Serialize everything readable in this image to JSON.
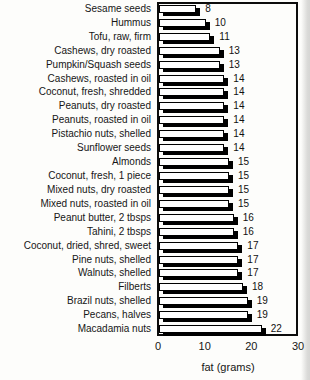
{
  "chart_data": {
    "type": "bar",
    "orientation": "horizontal",
    "categories": [
      "Sesame seeds",
      "Hummus",
      "Tofu, raw, firm",
      "Cashews, dry roasted",
      "Pumpkin/Squash seeds",
      "Cashews, roasted in oil",
      "Coconut, fresh, shredded",
      "Peanuts, dry roasted",
      "Peanuts, roasted in oil",
      "Pistachio nuts, shelled",
      "Sunflower seeds",
      "Almonds",
      "Coconut, fresh, 1 piece",
      "Mixed nuts, dry roasted",
      "Mixed nuts, roasted in oil",
      "Peanut butter, 2 tbsps",
      "Tahini, 2 tbsps",
      "Coconut, dried, shred, sweet",
      "Pine nuts, shelled",
      "Walnuts, shelled",
      "Filberts",
      "Brazil nuts, shelled",
      "Pecans, halves",
      "Macadamia nuts"
    ],
    "values": [
      8,
      10,
      11,
      13,
      13,
      14,
      14,
      14,
      14,
      14,
      14,
      15,
      15,
      15,
      15,
      16,
      16,
      17,
      17,
      17,
      18,
      19,
      19,
      22
    ],
    "value_labels": [
      "8",
      "10",
      "11",
      "13",
      "13",
      "14",
      "14",
      "14",
      "14",
      "14",
      "14",
      "15",
      "15",
      "15",
      "15",
      "16",
      "16",
      "17",
      "17",
      "17",
      "18",
      "19",
      "19",
      "22"
    ],
    "xlabel": "fat (grams)",
    "xlim": [
      0,
      30
    ],
    "xticks": [
      0,
      10,
      20,
      30
    ],
    "grid": false,
    "legend": false,
    "bar_fill": "#ffffff",
    "bar_border": "#000000",
    "bar_shadow_color": "#000000",
    "frame_color": "#0c0c0c"
  }
}
